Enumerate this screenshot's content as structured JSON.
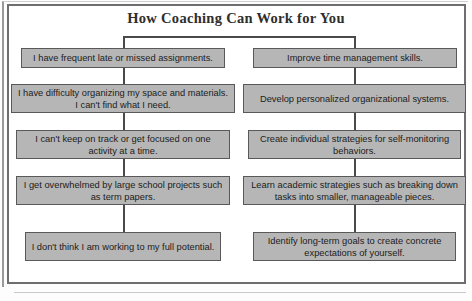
{
  "title": "How Coaching Can Work for You",
  "columns": {
    "left": {
      "label": "Student challenges",
      "nodes": [
        "I have frequent late or missed assignments.",
        "I have difficulty organizing my space and materials. I can't find what I need.",
        "I can't keep on track or get focused on one activity at a time.",
        "I get overwhelmed by large school projects such as term papers.",
        "I don't think I am working to my full potential."
      ]
    },
    "right": {
      "label": "Coaching outcomes",
      "nodes": [
        "Improve time management skills.",
        "Develop personalized organizational systems.",
        "Create individual strategies for self-monitoring behaviors.",
        "Learn academic strategies such as breaking down tasks into smaller, manageable pieces.",
        "Identify long-term goals to create concrete expectations of yourself."
      ]
    }
  },
  "footer": {
    "partial_text": ""
  },
  "colors": {
    "node_fill": "#b6b6b6",
    "node_border": "#595959",
    "connector": "#4a4a4a",
    "frame": "#6e6e6e",
    "title_text": "#2e2e2e"
  }
}
